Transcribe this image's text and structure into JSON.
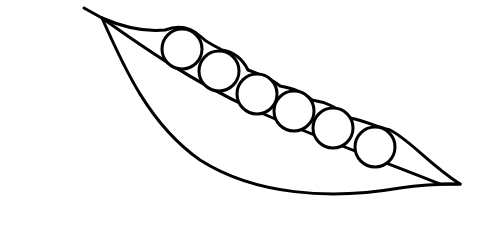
{
  "illustration": {
    "subject": "pea pod",
    "stroke_color": "#000000",
    "background_color": "#ffffff",
    "pea_count": 6,
    "peas": [
      {
        "cx": 182,
        "cy": 49,
        "r": 20
      },
      {
        "cx": 219,
        "cy": 71,
        "r": 20
      },
      {
        "cx": 257,
        "cy": 94,
        "r": 20
      },
      {
        "cx": 294,
        "cy": 111,
        "r": 20
      },
      {
        "cx": 333,
        "cy": 128,
        "r": 20
      },
      {
        "cx": 375,
        "cy": 147,
        "r": 20
      }
    ]
  }
}
